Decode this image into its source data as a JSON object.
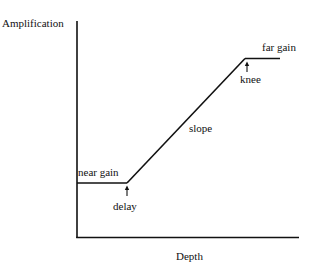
{
  "diagram": {
    "type": "piecewise-linear gain curve",
    "axes": {
      "y_label": "Amplification",
      "x_label": "Depth"
    },
    "annotations": {
      "near_gain": "near gain",
      "delay": "delay",
      "slope": "slope",
      "knee": "knee",
      "far_gain": "far gain"
    },
    "colors": {
      "line": "#111111",
      "background": "#ffffff"
    }
  }
}
